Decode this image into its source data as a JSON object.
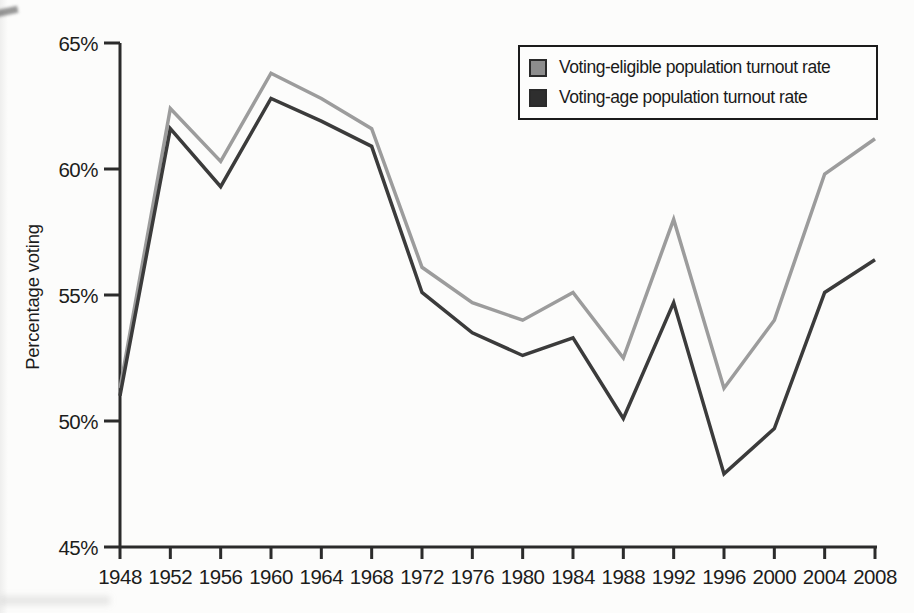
{
  "colors": {
    "axis": "#2b2b2b",
    "text": "#1c1c1c",
    "legend_border": "#1b1b1b",
    "background": "#fcfcfb"
  },
  "chart_data": {
    "type": "line",
    "title": "",
    "xlabel": "",
    "ylabel": "Percentage voting",
    "x": [
      1948,
      1952,
      1956,
      1960,
      1964,
      1968,
      1972,
      1976,
      1980,
      1984,
      1988,
      1992,
      1996,
      2000,
      2004,
      2008
    ],
    "series": [
      {
        "name": "Voting-eligible population turnout rate",
        "color": "#9c9c9c",
        "swatch_color": "#8d8d8d",
        "values": [
          51.3,
          62.4,
          60.3,
          63.8,
          62.8,
          61.6,
          56.1,
          54.7,
          54.0,
          55.1,
          52.5,
          58.0,
          51.3,
          54.0,
          59.8,
          61.2
        ]
      },
      {
        "name": "Voting-age population turnout rate",
        "color": "#3b3b3b",
        "swatch_color": "#2e2e2e",
        "values": [
          51.0,
          61.6,
          59.3,
          62.8,
          61.9,
          60.9,
          55.1,
          53.5,
          52.6,
          53.3,
          50.1,
          54.7,
          47.9,
          49.7,
          55.1,
          56.4
        ]
      }
    ],
    "ylim": [
      45,
      65
    ],
    "yticks": [
      45,
      50,
      55,
      60,
      65
    ],
    "ytick_labels": [
      "45%",
      "50%",
      "55%",
      "60%",
      "65%"
    ],
    "grid": false,
    "legend_position": "top-right"
  }
}
